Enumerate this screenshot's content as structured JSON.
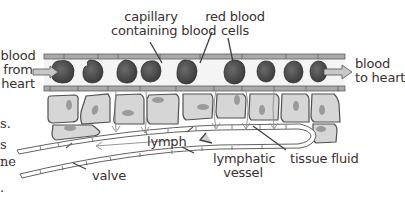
{
  "diagram": {
    "type": "labelled biological diagram",
    "labels": {
      "capillary": [
        "capillary",
        "containing blood"
      ],
      "red_blood_cells": [
        "red blood",
        "cells"
      ],
      "blood_from_heart": [
        "blood",
        "from",
        "heart"
      ],
      "blood_to_heart": [
        "blood",
        "to heart"
      ],
      "lymph": "lymph",
      "lymphatic_vessel": [
        "lymphatic",
        "vessel"
      ],
      "tissue_fluid": "tissue fluid",
      "valve": "valve"
    },
    "cut_off_left_text": [
      "s.",
      "s",
      "ne",
      "."
    ],
    "colors": {
      "capillary_wall": "#a9a9a9",
      "capillary_lumen": "#f4f4f4",
      "red_blood_cell": "#4a4a4a",
      "tissue_cell_fill": "#d6d6d6",
      "nucleus": "#9a9a9a",
      "outline": "#505050",
      "arrow_fill": "#c8c8c8",
      "text": "#3a3030"
    }
  }
}
